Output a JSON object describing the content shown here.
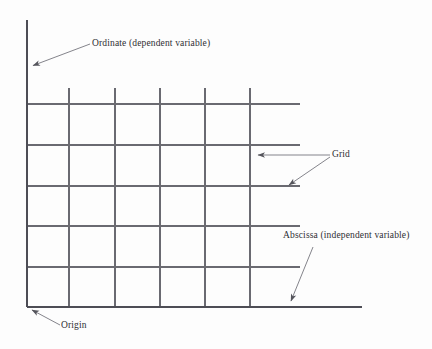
{
  "figure": {
    "type": "diagram",
    "background_color": "#fdfdfd",
    "ink_color": "#55555c",
    "text_color": "#2e2e33"
  },
  "labels": {
    "ordinate": "Ordinate (dependent variable)",
    "grid": "Grid",
    "abscissa": "Abscissa (independent variable)",
    "origin": "Origin"
  },
  "axes": {
    "origin_point": {
      "x": 27,
      "y": 307
    },
    "y_axis": {
      "x": 27,
      "y_top": 20,
      "y_bottom": 307
    },
    "x_axis": {
      "y": 307,
      "x_left": 27,
      "x_right": 362
    }
  },
  "grid": {
    "vertical_lines_x": [
      69,
      115,
      160,
      205,
      250
    ],
    "vertical_line_top_y": 88,
    "vertical_line_bottom_y": 307,
    "horizontal_lines_y": [
      104,
      145,
      186,
      226,
      267
    ],
    "horizontal_line_left_x": 27,
    "horizontal_line_right_x": 300
  },
  "leaders": [
    {
      "name": "ordinate-leader",
      "from": {
        "x": 90,
        "y": 44
      },
      "to": {
        "x": 30,
        "y": 66
      },
      "arrow_at": "to"
    },
    {
      "name": "grid-leader-vertical",
      "from": {
        "x": 330,
        "y": 155
      },
      "to": {
        "x": 254,
        "y": 155
      },
      "arrow_at": "to"
    },
    {
      "name": "grid-leader-horizontal",
      "from": {
        "x": 330,
        "y": 157
      },
      "to": {
        "x": 286,
        "y": 187
      },
      "arrow_at": "to"
    },
    {
      "name": "abscissa-leader",
      "from": {
        "x": 313,
        "y": 247
      },
      "to": {
        "x": 289,
        "y": 304
      },
      "arrow_at": "to"
    },
    {
      "name": "origin-leader",
      "from": {
        "x": 60,
        "y": 325
      },
      "to": {
        "x": 29,
        "y": 309
      },
      "arrow_at": "to"
    }
  ]
}
